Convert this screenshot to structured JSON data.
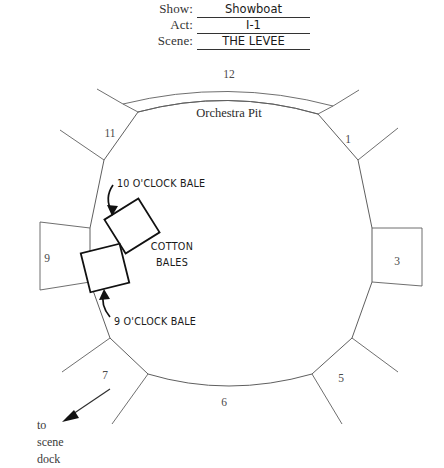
{
  "header": {
    "show_label": "Show:",
    "show_value": "Showboat",
    "act_label": "Act:",
    "act_value": "I-1",
    "scene_label": "Scene:",
    "scene_value": "THE LEVEE"
  },
  "diagram": {
    "orchestra_pit_label": "Orchestra Pit",
    "cotton_bales_line1": "COTTON",
    "cotton_bales_line2": "BALES",
    "bale_10_label": "10 O'CLOCK BALE",
    "bale_9_label": "9 O'CLOCK BALE",
    "scene_dock_line1": "to",
    "scene_dock_line2": "scene",
    "scene_dock_line3": "dock",
    "wing_numbers": [
      {
        "id": "wing-1",
        "label": "1",
        "x": 348,
        "y": 143
      },
      {
        "id": "wing-3",
        "label": "3",
        "x": 397,
        "y": 265
      },
      {
        "id": "wing-5",
        "label": "5",
        "x": 341,
        "y": 382
      },
      {
        "id": "wing-6",
        "label": "6",
        "x": 224,
        "y": 406
      },
      {
        "id": "wing-7",
        "label": "7",
        "x": 105,
        "y": 379
      },
      {
        "id": "wing-9",
        "label": "9",
        "x": 47,
        "y": 262
      },
      {
        "id": "wing-11",
        "label": "11",
        "x": 110,
        "y": 137
      },
      {
        "id": "wing-12",
        "label": "12",
        "x": 229,
        "y": 78
      }
    ]
  },
  "colors": {
    "ink": "#2b2b2b",
    "line": "#5f5f5f",
    "bale_outline": "#111111",
    "background": "#ffffff"
  }
}
